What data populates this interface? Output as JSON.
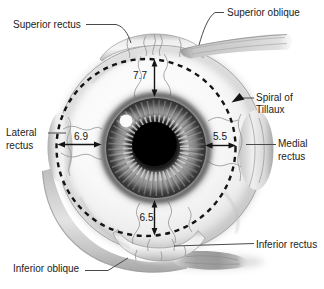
{
  "anatomy_labels": {
    "superior_rectus": "Superior rectus",
    "superior_oblique": "Superior oblique",
    "spiral_of_tillaux": {
      "line1": "Spiral of",
      "line2": "Tillaux"
    },
    "lateral_rectus": {
      "line1": "Lateral",
      "line2": "rectus"
    },
    "medial_rectus": {
      "line1": "Medial",
      "line2": "rectus"
    },
    "inferior_rectus": "Inferior rectus",
    "inferior_oblique": "Inferior oblique"
  },
  "measurements_mm": {
    "superior": "7.7",
    "lateral": "6.9",
    "medial": "5.5",
    "inferior": "6.5"
  },
  "colors": {
    "background": "#ffffff",
    "label_text": "#1c1c1c",
    "leader_line": "#4a4a4a",
    "measure_line": "#141414",
    "dashed_curve": "#141414"
  }
}
